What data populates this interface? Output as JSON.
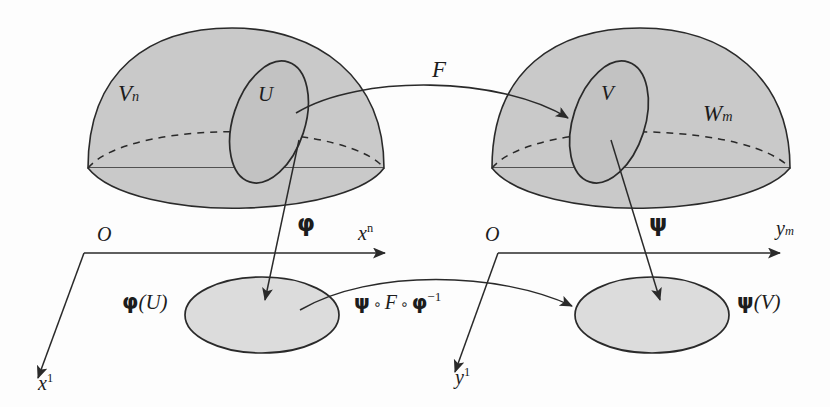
{
  "figure": {
    "type": "manifold-chart-commutative-diagram"
  },
  "colors": {
    "dome_fill": "#c9c9c9",
    "patch_fill": "#c2c2c2",
    "chart_ellipse_fill": "#dcdcdc",
    "stroke": "#2a2a2a",
    "background": "#fdfdfd"
  },
  "manifolds": [
    {
      "id": "source",
      "label_base": "V",
      "label_sub": "n",
      "open_set_label": "U"
    },
    {
      "id": "target",
      "label_base": "W",
      "label_sub": "m",
      "open_set_label": "V"
    }
  ],
  "maps": {
    "F": "F",
    "phi": "φ",
    "psi": "ψ",
    "composite_psi": "ψ",
    "composite_ring1": "∘",
    "composite_F": "F",
    "composite_ring2": "∘",
    "composite_phi": "φ",
    "composite_inverse": "−1"
  },
  "charts": [
    {
      "id": "left-chart",
      "origin_label": "O",
      "axis_horizontal_base": "x",
      "axis_horizontal_sup": "n",
      "axis_diagonal_base": "x",
      "axis_diagonal_sup": "1",
      "image_label_map": "φ",
      "image_label_open": "(U)"
    },
    {
      "id": "right-chart",
      "origin_label": "O",
      "axis_horizontal_base": "y",
      "axis_horizontal_sub": "m",
      "axis_diagonal_base": "y",
      "axis_diagonal_sup": "1",
      "image_label_map": "ψ",
      "image_label_open": "(V)"
    }
  ]
}
